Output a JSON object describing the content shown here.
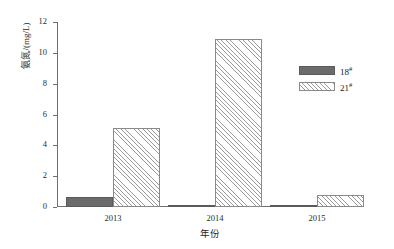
{
  "chart_data": {
    "type": "bar",
    "title": "",
    "subtitle": "",
    "xlabel": "年份",
    "ylabel": "氨氮/(mg/L)",
    "categories": [
      "2013",
      "2014",
      "2015"
    ],
    "series": [
      {
        "name": "18#",
        "name_base": "18",
        "name_sup": "#",
        "values": [
          0.65,
          0.03,
          0.03
        ],
        "style": "solid-gray",
        "color": "#6b6b6b"
      },
      {
        "name": "21#",
        "name_base": "21",
        "name_sup": "#",
        "values": [
          5.1,
          10.9,
          0.8
        ],
        "style": "diagonal-hatch",
        "color": "#ffffff"
      }
    ],
    "ylim": [
      0,
      12
    ],
    "yticks": [
      0,
      2,
      4,
      6,
      8,
      10,
      12
    ],
    "ytick_labels": [
      "0",
      "2",
      "4",
      "6",
      "8",
      "10",
      "12"
    ],
    "grid": false,
    "legend_position": "top-right",
    "axis_color": "#6f6f6f"
  }
}
